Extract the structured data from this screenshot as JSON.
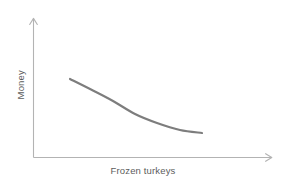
{
  "figure": {
    "background_color": "#ffffff",
    "width": 286,
    "height": 187
  },
  "axes": {
    "color": "#b3b3b3",
    "x_axis_name": "x-axis-line",
    "y_axis_name": "y-axis-line",
    "arrowheads": true
  },
  "labels": {
    "x": "Frozen turkeys",
    "y": "Money",
    "color": "#5c5c5c"
  },
  "chart_data": {
    "type": "line",
    "title": "",
    "subtitle": "",
    "xlabel": "Frozen turkeys",
    "ylabel": "Money",
    "grid": false,
    "legend": false,
    "legend_position": "none",
    "axis_ticks": false,
    "tick_labels": [],
    "xlim": [
      0,
      10
    ],
    "ylim": [
      0,
      10
    ],
    "annotations": [],
    "series": [
      {
        "name": "demand-curve",
        "color": "#7d7d7d",
        "line_width": 2.2,
        "style": "smooth-convex-decreasing",
        "x": [
          1.6,
          2.5,
          3.4,
          4.3,
          5.2,
          6.1,
          7.0
        ],
        "y": [
          5.6,
          5.0,
          4.4,
          3.9,
          3.5,
          3.2,
          3.1
        ],
        "pixel_points": [
          [
            70,
            79
          ],
          [
            92,
            90
          ],
          [
            113,
            101
          ],
          [
            135,
            114
          ],
          [
            157,
            123
          ],
          [
            180,
            130
          ],
          [
            202,
            133
          ]
        ]
      }
    ]
  }
}
